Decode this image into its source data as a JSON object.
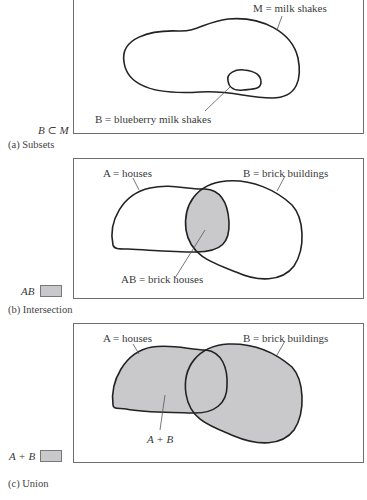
{
  "panels": [
    {
      "id": "a",
      "caption": "(a) Subsets",
      "relation": "B ⊂ M",
      "labels": {
        "outer": "M = milk shakes",
        "inner": "B = blueberry milk shakes"
      }
    },
    {
      "id": "b",
      "caption": "(b) Intersection",
      "legend": "AB",
      "labels": {
        "set_a": "A = houses",
        "set_b": "B = brick buildings",
        "region": "AB = brick houses"
      }
    },
    {
      "id": "c",
      "caption": "(c) Union",
      "legend": "A + B",
      "labels": {
        "set_a": "A = houses",
        "set_b": "B = brick buildings",
        "region": "A + B"
      }
    }
  ],
  "colors": {
    "shade": "#c9c9cc",
    "stroke": "#222222",
    "frame": "#6e6e6e",
    "leader": "#555555"
  }
}
